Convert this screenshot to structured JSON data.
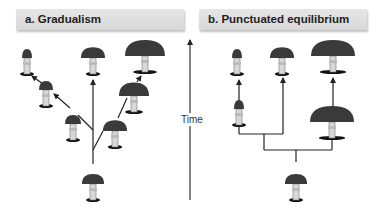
{
  "panels": {
    "a": {
      "label": "a. Gradualism"
    },
    "b": {
      "label": "b. Punctuated equilibrium"
    }
  },
  "axis": {
    "label": "Time",
    "direction": "up"
  },
  "colors": {
    "header_bg": "#dcdcdc",
    "line": "#222222",
    "cap": "#3a3a3a",
    "stem": "#d8d8d8"
  },
  "mushrooms": {
    "gradualism": [
      {
        "id": "ancestor",
        "x": 93,
        "y": 200,
        "cap": 22
      },
      {
        "id": "lower-left",
        "x": 73,
        "y": 140,
        "cap": 16
      },
      {
        "id": "mid-left",
        "x": 46,
        "y": 106,
        "cap": 14
      },
      {
        "id": "top-left",
        "x": 27,
        "y": 74,
        "cap": 10
      },
      {
        "id": "top-center",
        "x": 93,
        "y": 74,
        "cap": 24
      },
      {
        "id": "lower-right",
        "x": 115,
        "y": 147,
        "cap": 24
      },
      {
        "id": "mid-right",
        "x": 134,
        "y": 112,
        "cap": 30
      },
      {
        "id": "top-right",
        "x": 145,
        "y": 72,
        "cap": 40
      }
    ],
    "punctuated": [
      {
        "id": "ancestor",
        "x": 296,
        "y": 200,
        "cap": 22
      },
      {
        "id": "mid-left",
        "x": 239,
        "y": 125,
        "cap": 10
      },
      {
        "id": "top-left",
        "x": 237,
        "y": 74,
        "cap": 10
      },
      {
        "id": "top-center",
        "x": 282,
        "y": 74,
        "cap": 24
      },
      {
        "id": "mid-right",
        "x": 332,
        "y": 138,
        "cap": 44
      },
      {
        "id": "top-right",
        "x": 333,
        "y": 72,
        "cap": 44
      }
    ]
  }
}
